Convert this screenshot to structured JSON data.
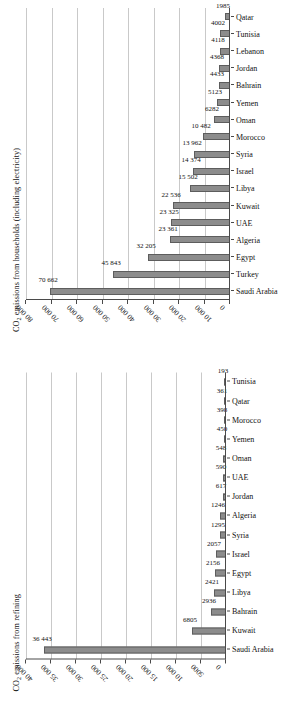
{
  "chart_data": [
    {
      "type": "bar",
      "id": "households",
      "title": "CO2 emissions from households (including electricity)",
      "title_prefix": "CO",
      "title_sub": "2",
      "title_rest": " emissions from households (including electricity)",
      "xlabel": "",
      "ylabel": "",
      "ylim": [
        0,
        80000
      ],
      "ytick_step": 10000,
      "grid": true,
      "orientation": "rotated-90-ccw",
      "bar_color": "#8c8c8c",
      "bar_border_color": "#5d5d5d",
      "ytick_labels": [
        "0",
        "10 000",
        "20 000",
        "30 000",
        "40 000",
        "50 000",
        "60 000",
        "70 000",
        "80 000"
      ],
      "categories": [
        "Saudi Arabia",
        "Turkey",
        "Egypt",
        "Algeria",
        "UAE",
        "Kuwait",
        "Libya",
        "Israel",
        "Syria",
        "Morocco",
        "Oman",
        "Yemen",
        "Bahrain",
        "Jordan",
        "Lebanon",
        "Tunisia",
        "Qatar"
      ],
      "values": [
        70662,
        45843,
        32205,
        23361,
        23325,
        22536,
        15502,
        14374,
        13962,
        10482,
        6282,
        5123,
        4433,
        4368,
        4118,
        4002,
        1985
      ],
      "value_labels": [
        "70 662",
        "45 843",
        "32 205",
        "23 361",
        "23 325",
        "22 536",
        "15 502",
        "14 374",
        "13 962",
        "10 482",
        "6282",
        "5123",
        "4433",
        "4368",
        "4118",
        "4002",
        "1985"
      ]
    },
    {
      "type": "bar",
      "id": "refining",
      "title": "CO2 emissions from refining",
      "title_prefix": "CO",
      "title_sub": "2",
      "title_rest": " emissions from refining",
      "xlabel": "",
      "ylabel": "",
      "ylim": [
        0,
        40000
      ],
      "ytick_step": 5000,
      "grid": true,
      "orientation": "rotated-90-ccw",
      "bar_color": "#8c8c8c",
      "bar_border_color": "#5d5d5d",
      "ytick_labels": [
        "0",
        "5000",
        "10 000",
        "15 000",
        "20 000",
        "25 000",
        "30 000",
        "35 000",
        "40 000"
      ],
      "categories": [
        "Saudi Arabia",
        "Kuwait",
        "Bahrain",
        "Libya",
        "Egypt",
        "Israel",
        "Syria",
        "Algeria",
        "Jordan",
        "UAE",
        "Oman",
        "Yemen",
        "Morocco",
        "Qatar",
        "Tunisia"
      ],
      "values": [
        36443,
        6805,
        2936,
        2421,
        2156,
        2057,
        1295,
        1246,
        617,
        590,
        548,
        450,
        398,
        361,
        193
      ],
      "value_labels": [
        "36 443",
        "6805",
        "2936",
        "2421",
        "2156",
        "2057",
        "1295",
        "1246",
        "617",
        "590",
        "548",
        "450",
        "398",
        "361",
        "193"
      ]
    }
  ]
}
